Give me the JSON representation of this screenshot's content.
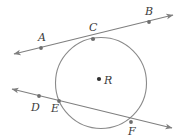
{
  "figure": {
    "background_color": "#ffffff",
    "stroke_color": "#7f7f7f",
    "label_color": "#3b3b3b",
    "point_color": "#6e6e6e"
  },
  "circle": {
    "name": "circle-r",
    "center_label": "R",
    "center_x": 101,
    "center_y": 83,
    "radius": 45.5
  },
  "points": [
    {
      "label": "A",
      "x": 41,
      "y": 48,
      "label_x": 38,
      "label_y": 41
    },
    {
      "label": "B",
      "x": 149,
      "y": 22,
      "label_x": 145,
      "label_y": 15
    },
    {
      "label": "C",
      "x": 93,
      "y": 39,
      "label_x": 89,
      "label_y": 31
    },
    {
      "label": "D",
      "x": 39,
      "y": 96,
      "label_x": 31,
      "label_y": 111
    },
    {
      "label": "E",
      "x": 59,
      "y": 101,
      "label_x": 51,
      "label_y": 112
    },
    {
      "label": "F",
      "x": 131,
      "y": 122,
      "label_x": 128,
      "label_y": 135
    },
    {
      "label": "R",
      "x": 99,
      "y": 79,
      "label_x": 104,
      "label_y": 84
    }
  ],
  "lines": [
    {
      "name": "tangent-line-ab",
      "from_x": 14,
      "from_y": 54,
      "to_x": 173,
      "to_y": 15,
      "arrow_start": true,
      "arrow_end": true
    },
    {
      "name": "secant-line-df",
      "from_x": 12,
      "from_y": 89,
      "to_x": 172,
      "to_y": 128,
      "arrow_start": true,
      "arrow_end": true
    }
  ]
}
